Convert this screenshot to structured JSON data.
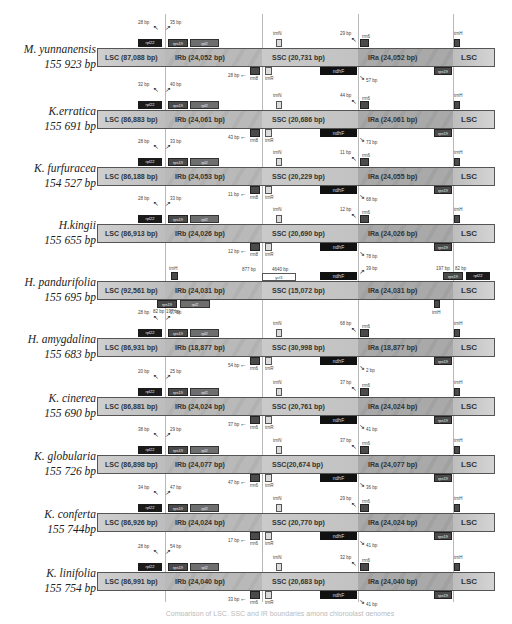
{
  "figure": {
    "type": "chloroplast-genome-IR-boundary-comparison",
    "regions": [
      "LSC",
      "IRb",
      "SSC",
      "IRa"
    ],
    "caption": "Comparison of LSC, SSC and IR boundaries among chloroplast genomes"
  },
  "rows": [
    {
      "species": "M. yunnanensis",
      "size": "155 923 bp",
      "lsc": "LSC (87,088 bp)",
      "irb": "IRb (24,052 bp)",
      "ssc": "SSC (20,731 bp)",
      "ira": "IRa (24,052 bp)",
      "lsc_end": "LSC",
      "top_genes": [
        "rpl22",
        "rps19",
        "rpl2",
        "trnN",
        "rrn6",
        "trnH"
      ],
      "bottom_genes": [
        "rrn8",
        "trnR",
        "ndhF",
        "rps19"
      ],
      "lsc_irb_left": "28 bp",
      "lsc_irb_right": "35 bp",
      "irb_ssc": "28 bp",
      "ssc_ira_top": "29 bp",
      "ssc_ira_bottom": "57 bp"
    },
    {
      "species": "K.erratica",
      "size": "155 691 bp",
      "lsc": "LSC (86,883 bp)",
      "irb": "IRb (24,061 bp)",
      "ssc": "SSC (20,686 bp)",
      "ira": "IRa (24,061 bp)",
      "lsc_end": "LSC",
      "top_genes": [
        "rpl22",
        "rps19",
        "rpl2",
        "trnN",
        "rrn6",
        "trnH"
      ],
      "bottom_genes": [
        "rrn8",
        "trnR",
        "ndhF",
        "rps19"
      ],
      "lsc_irb_left": "32 bp",
      "lsc_irb_right": "40 bp",
      "irb_ssc": "43 bp",
      "ssc_ira_top": "44 bp",
      "ssc_ira_bottom": "73 bp"
    },
    {
      "species": "K. furfuracea",
      "size": "154 527 bp",
      "lsc": "LSC (86,188 bp)",
      "irb": "IRb (24,053 bp)",
      "ssc": "SSC (20,229 bp)",
      "ira": "IRa (24,055 bp)",
      "lsc_end": "LSC",
      "top_genes": [
        "rpl22",
        "rps19",
        "rpl2",
        "trnN",
        "rrn6",
        "trnH"
      ],
      "bottom_genes": [
        "rrn8",
        "trnR",
        "ndhF",
        "rps19"
      ],
      "lsc_irb_left": "28 bp",
      "lsc_irb_right": "33 bp",
      "irb_ssc": "11 bp",
      "ssc_ira_top": "11 bp",
      "ssc_ira_bottom": "68 bp"
    },
    {
      "species": "H.kingii",
      "size": "155 655 bp",
      "lsc": "LSC (86,913 bp)",
      "irb": "IRb (24,026 bp)",
      "ssc": "SSC (20,690 bp)",
      "ira": "IRa (24,026 bp)",
      "lsc_end": "LSC",
      "top_genes": [
        "rpl22",
        "rps19",
        "rpl2",
        "trnN",
        "rrn6",
        "trnH"
      ],
      "bottom_genes": [
        "rrn8",
        "trnR",
        "ndhF",
        "rps19"
      ],
      "lsc_irb_left": "28 bp",
      "lsc_irb_right": "33 bp",
      "irb_ssc": "12 bp",
      "ssc_ira_top": "12 bp",
      "ssc_ira_bottom": "78 bp"
    },
    {
      "species": "H. pandurifolia",
      "size": "155 695 bp",
      "lsc": "LSC (92,561 bp)",
      "irb": "IRb (24,031 bp)",
      "ssc": "SSC (15,072 bp)",
      "ira": "IRa (24,031 bp)",
      "lsc_end": "LSC",
      "top_genes": [
        "trnH",
        "ycf1",
        "ndhF",
        "rps19",
        "rpl22"
      ],
      "bottom_genes": [
        "rps19",
        "rpl2",
        "trnH"
      ],
      "lsc_irb_left": "82 bp",
      "lsc_irb_right": "197 bp",
      "irb_ssc": "877 bp",
      "ycf1_label": "4640 bp",
      "ssc_ira_top": "39 bp",
      "ira_lsc_left": "197 bp",
      "ira_lsc_right": "82 bp"
    },
    {
      "species": "H. amygdalina",
      "size": "155 683 bp",
      "lsc": "LSC (86,931 bp)",
      "irb": "IRb (18,877 bp)",
      "ssc": "SSC (30,998 bp)",
      "ira": "IRa (18,877 bp)",
      "lsc_end": "LSC",
      "top_genes": [
        "rpl22",
        "rps19",
        "rpl2",
        "trnN",
        "rrn6",
        "trnH"
      ],
      "bottom_genes": [
        "rrn6",
        "trnR",
        "ndhF",
        "rps19"
      ],
      "lsc_irb_left": "28 bp",
      "lsc_irb_right": "37 bp",
      "irb_ssc": "54 bp",
      "ssc_ira_top": "68 bp",
      "ssc_ira_bottom": "2 bp"
    },
    {
      "species": "K. cinerea",
      "size": "155 690 bp",
      "lsc": "LSC (86,881 bp)",
      "irb": "IRb (24,024 bp)",
      "ssc": "SSC (20,761 bp)",
      "ira": "IRa (24,024 bp)",
      "lsc_end": "LSC",
      "top_genes": [
        "rpl22",
        "rps19",
        "rpl2",
        "trnN",
        "rrn6",
        "trnH"
      ],
      "bottom_genes": [
        "rrn6",
        "trnR",
        "ndhF",
        "rps19"
      ],
      "lsc_irb_left": "20 bp",
      "lsc_irb_right": "25 bp",
      "irb_ssc": "37 bp",
      "ssc_ira_top": "37 bp",
      "ssc_ira_bottom": "41 bp"
    },
    {
      "species": "K. globularia",
      "size": "155 726 bp",
      "lsc": "LSC (86,898 bp)",
      "irb": "IRb (24,077 bp)",
      "ssc": "SSC(20,674 bp)",
      "ira": "IRa (24,077 bp)",
      "lsc_end": "LSC",
      "top_genes": [
        "rpl22",
        "rps19",
        "rpl2",
        "trnN",
        "rrn6",
        "trnH"
      ],
      "bottom_genes": [
        "rrn6",
        "trnR",
        "ndhF",
        "rps19"
      ],
      "lsc_irb_left": "38 bp",
      "lsc_irb_right": "29 bp",
      "irb_ssc": "47 bp",
      "ssc_ira_top": "37 bp",
      "ssc_ira_bottom": "36 bp"
    },
    {
      "species": "K. conferta",
      "size": "155 744bp",
      "lsc": "LSC (86,926 bp)",
      "irb": "IRb (24,024 bp)",
      "ssc": "SSC (20,770 bp)",
      "ira": "IRa (24,024 bp)",
      "lsc_end": "LSC",
      "top_genes": [
        "rpl22",
        "rps19",
        "rpl2",
        "trnN",
        "rrn6",
        "trnH"
      ],
      "bottom_genes": [
        "rrn6",
        "trnR",
        "ndhF",
        "rps19"
      ],
      "lsc_irb_left": "34 bp",
      "lsc_irb_right": "47 bp",
      "irb_ssc": "17 bp",
      "ssc_ira_top": "29 bp",
      "ssc_ira_bottom": "41 bp"
    },
    {
      "species": "K. linifolia",
      "size": "155 754 bp",
      "lsc": "LSC (86,991 bp)",
      "irb": "IRb (24,040 bp)",
      "ssc": "SSC (20,683 bp)",
      "ira": "IRa (24,040 bp)",
      "lsc_end": "LSC",
      "top_genes": [
        "rpl22",
        "rps19",
        "rpl2",
        "trnN",
        "rrn6",
        "trnH"
      ],
      "bottom_genes": [
        "rrn6",
        "trnR",
        "ndhF",
        "rps19"
      ],
      "lsc_irb_left": "28 bp",
      "lsc_irb_right": "54 bp",
      "irb_ssc": "33 bp",
      "ssc_ira_top": "32 bp",
      "ssc_ira_bottom": "41 bp"
    }
  ]
}
